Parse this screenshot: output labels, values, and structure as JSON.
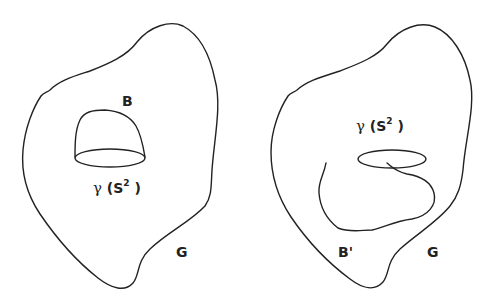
{
  "figure": {
    "panels": [
      {
        "id": "left",
        "region_label": "G",
        "ball_label": "B",
        "sphere_label": {
          "symbol": "γ",
          "open": "(S",
          "superscript": "2",
          "close": ")"
        }
      },
      {
        "id": "right",
        "region_label": "G",
        "ball_label": "B'",
        "sphere_label": {
          "symbol": "γ",
          "open": "(S",
          "superscript": "2",
          "close": ")"
        }
      }
    ],
    "colors": {
      "stroke": "#222222",
      "background": "#ffffff"
    }
  }
}
